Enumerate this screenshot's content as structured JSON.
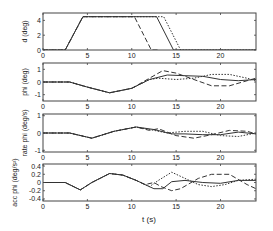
{
  "figure": {
    "xlabel": "t (s)",
    "x_ticks": [
      "0",
      "5",
      "10",
      "15",
      "20"
    ]
  },
  "chart_data": [
    {
      "type": "line",
      "title": "",
      "xlabel": "",
      "ylabel": "d (deg)",
      "xlim": [
        0,
        24
      ],
      "ylim": [
        0,
        5
      ],
      "yticks": [
        0,
        2,
        4
      ],
      "ytick_labels": [
        "0",
        "2",
        "4"
      ],
      "xtick_labels": [
        "0",
        "5",
        "10",
        "15",
        "20"
      ],
      "grid": false,
      "series": [
        {
          "name": "solid",
          "style": "solid",
          "x": [
            0,
            2.5,
            4.5,
            12.8,
            14.7,
            24
          ],
          "y": [
            0,
            0,
            4.5,
            4.5,
            0,
            0
          ]
        },
        {
          "name": "dashed",
          "style": "dashed",
          "x": [
            0,
            2.5,
            4.5,
            10.3,
            12.2,
            13.0
          ],
          "y": [
            0,
            0,
            4.5,
            4.5,
            0,
            0
          ]
        },
        {
          "name": "dotted",
          "style": "dotted",
          "x": [
            0,
            2.5,
            4.5,
            13.6,
            15.5,
            24
          ],
          "y": [
            0,
            0,
            4.5,
            4.5,
            0,
            0
          ]
        }
      ]
    },
    {
      "type": "line",
      "title": "",
      "xlabel": "",
      "ylabel": "phi (deg)",
      "xlim": [
        0,
        24
      ],
      "ylim": [
        -1.5,
        1.5
      ],
      "yticks": [
        -1,
        0,
        1
      ],
      "ytick_labels": [
        "-1",
        "0",
        "1"
      ],
      "xtick_labels": [
        "0",
        "5",
        "10",
        "15",
        "20"
      ],
      "grid": false,
      "series": [
        {
          "name": "solid",
          "style": "solid",
          "x": [
            0,
            3,
            5,
            7.5,
            10,
            12,
            14,
            16,
            18,
            20,
            22,
            24
          ],
          "y": [
            0,
            0,
            -0.4,
            -0.85,
            -0.5,
            0.2,
            0.55,
            0.5,
            0.45,
            0.2,
            0.1,
            0.2
          ]
        },
        {
          "name": "dashed",
          "style": "dashed",
          "x": [
            0,
            3,
            5,
            7.5,
            10,
            12,
            13.5,
            15,
            17,
            19,
            21,
            23,
            24
          ],
          "y": [
            0,
            0,
            -0.4,
            -0.85,
            -0.5,
            0.3,
            0.9,
            0.7,
            0.2,
            -0.3,
            -0.3,
            0.1,
            0.3
          ]
        },
        {
          "name": "dotted",
          "style": "dotted",
          "x": [
            0,
            3,
            5,
            7.5,
            10,
            12,
            13,
            15,
            17,
            19,
            21,
            23,
            24
          ],
          "y": [
            0,
            0,
            -0.4,
            -0.85,
            -0.5,
            0.2,
            0.3,
            0.2,
            0.3,
            0.6,
            0.6,
            0.3,
            0.1
          ]
        }
      ]
    },
    {
      "type": "line",
      "title": "",
      "xlabel": "",
      "ylabel": "rate phi (deg/s)",
      "xlim": [
        0,
        24
      ],
      "ylim": [
        -1.1,
        1.1
      ],
      "yticks": [
        -1,
        0,
        1
      ],
      "ytick_labels": [
        "-1",
        "0",
        "1"
      ],
      "xtick_labels": [
        "0",
        "5",
        "10",
        "15",
        "20"
      ],
      "grid": false,
      "series": [
        {
          "name": "solid",
          "style": "solid",
          "x": [
            0,
            3,
            5.5,
            8,
            10.5,
            12.5,
            14.5,
            16,
            18,
            20,
            22,
            24
          ],
          "y": [
            0,
            0,
            -0.3,
            0.1,
            0.35,
            0.2,
            -0.05,
            -0.05,
            -0.1,
            -0.1,
            0.05,
            -0.05
          ]
        },
        {
          "name": "dashed",
          "style": "dashed",
          "x": [
            0,
            3,
            5.5,
            8,
            10.5,
            12,
            13,
            15,
            17,
            19,
            21,
            23,
            24
          ],
          "y": [
            0,
            0,
            -0.3,
            0.1,
            0.35,
            0.15,
            0.25,
            -0.15,
            -0.3,
            -0.1,
            0.15,
            0.1,
            -0.05
          ]
        },
        {
          "name": "dotted",
          "style": "dotted",
          "x": [
            0,
            3,
            5.5,
            8,
            10.5,
            12,
            14,
            16,
            18,
            20,
            22,
            24
          ],
          "y": [
            0,
            0,
            -0.3,
            0.1,
            0.35,
            0.2,
            0.0,
            0.1,
            0.1,
            -0.15,
            -0.2,
            0.0
          ]
        }
      ]
    },
    {
      "type": "line",
      "title": "",
      "xlabel": "t (s)",
      "ylabel": "acc phi (deg/s²)",
      "xlim": [
        0,
        24
      ],
      "ylim": [
        -0.45,
        0.45
      ],
      "yticks": [
        -0.4,
        -0.2,
        0,
        0.2,
        0.4
      ],
      "ytick_labels": [
        "-0.4",
        "-0.2",
        "0",
        "0.2",
        "0.4"
      ],
      "xtick_labels": [
        "0",
        "5",
        "10",
        "15",
        "20"
      ],
      "grid": false,
      "series": [
        {
          "name": "solid",
          "style": "solid",
          "x": [
            0,
            2.5,
            4.2,
            5.5,
            7.5,
            9,
            10.5,
            11.5,
            12.5,
            13.5,
            14.5,
            16,
            18,
            20,
            22,
            24
          ],
          "y": [
            0,
            0,
            -0.18,
            0.0,
            0.22,
            0.18,
            0.05,
            -0.05,
            -0.15,
            -0.15,
            0.02,
            0.05,
            0.0,
            -0.02,
            0.05,
            0.05
          ]
        },
        {
          "name": "dashed",
          "style": "dashed",
          "x": [
            0,
            2.5,
            4.2,
            5.5,
            7.5,
            9,
            10.5,
            11.5,
            12.5,
            13.3,
            14.5,
            15.5,
            17.5,
            19,
            21,
            23,
            24
          ],
          "y": [
            0,
            0,
            -0.18,
            0.0,
            0.22,
            0.18,
            0.05,
            -0.05,
            0.0,
            -0.1,
            -0.2,
            -0.15,
            0.1,
            0.2,
            0.2,
            -0.05,
            -0.15
          ]
        },
        {
          "name": "dotted",
          "style": "dotted",
          "x": [
            0,
            2.5,
            4.2,
            5.5,
            7.5,
            9,
            10.5,
            12,
            13,
            14.5,
            16,
            17.5,
            19,
            20.5,
            22,
            24
          ],
          "y": [
            0,
            0,
            -0.18,
            0.0,
            0.22,
            0.18,
            0.05,
            -0.1,
            0.05,
            0.25,
            0.1,
            -0.05,
            -0.1,
            -0.05,
            0.05,
            0.08
          ]
        }
      ]
    }
  ]
}
